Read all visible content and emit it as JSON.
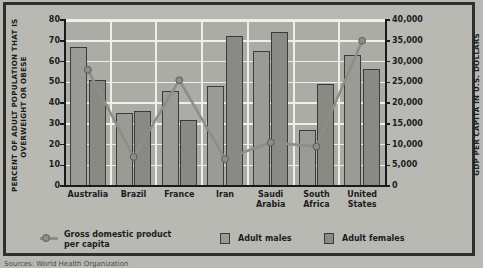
{
  "chart_data": {
    "type": "bar",
    "title": "",
    "categories": [
      "Australia",
      "Brazil",
      "France",
      "Iran",
      "Saudi Arabia",
      "South Africa",
      "United States"
    ],
    "series": [
      {
        "name": "Adult males",
        "values": [
          67,
          35,
          46,
          48,
          65,
          27,
          63
        ],
        "axis": "left",
        "color": "#9b9b95"
      },
      {
        "name": "Adult females",
        "values": [
          51,
          36,
          32,
          72.5,
          74,
          49,
          56.5
        ],
        "axis": "left",
        "color": "#8a8a84"
      },
      {
        "name": "Gross domestic product per capita",
        "values": [
          28000,
          7000,
          25500,
          6500,
          10500,
          9500,
          35000
        ],
        "axis": "right",
        "color": "#8e8e88",
        "type": "line"
      }
    ],
    "xlabel": "",
    "ylabel": "PERCENT OF ADULT POPULATION THAT IS OVERWEIGHT OR OBESE",
    "ylabel_right": "GDP PER CAPITA IN U.S. DOLLARS",
    "ylim": [
      0,
      80
    ],
    "ylim_right": [
      0,
      40000
    ],
    "yticks": [
      0,
      10,
      20,
      30,
      40,
      50,
      60,
      70,
      80
    ],
    "yticks_right": [
      0,
      5000,
      10000,
      15000,
      20000,
      25000,
      30000,
      35000,
      40000
    ],
    "ytick_labels": [
      "0",
      "10",
      "20",
      "30",
      "40",
      "50",
      "60",
      "70",
      "80"
    ],
    "ytick_labels_right": [
      "0",
      "5,000",
      "10,000",
      "15,000",
      "20,000",
      "25,000",
      "30,000",
      "35,000",
      "40,000"
    ],
    "grid": true,
    "legend_position": "bottom"
  },
  "axes": {
    "left_title": "PERCENT OF ADULT POPULATION THAT IS\nOVERWEIGHT OR OBESE",
    "right_title": "GDP PER CAPITA IN U.S. DOLLARS"
  },
  "categories": [
    {
      "label": "Australia"
    },
    {
      "label": "Brazil"
    },
    {
      "label": "France"
    },
    {
      "label": "Iran"
    },
    {
      "label": "Saudi\nArabia"
    },
    {
      "label": "South\nAfrica"
    },
    {
      "label": "United\nStates"
    }
  ],
  "legend": {
    "gdp_label": "Gross domestic product\nper capita",
    "males_label": "Adult males",
    "females_label": "Adult females"
  },
  "source_note": "Sources: World Health Organization"
}
